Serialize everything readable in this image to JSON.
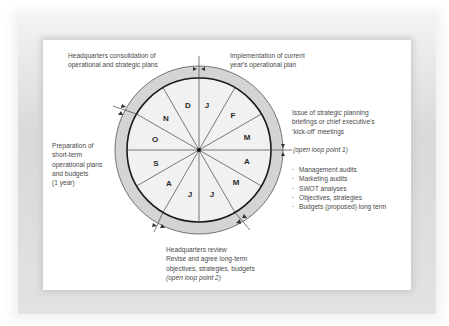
{
  "diagram": {
    "type": "planning-cycle-wheel",
    "months": [
      "J",
      "F",
      "M",
      "A",
      "M",
      "J",
      "J",
      "A",
      "S",
      "O",
      "N",
      "D"
    ],
    "annotations": {
      "top_left": [
        "Headquarters consolidation of",
        "operational and strategic plans"
      ],
      "top_right": [
        "Implementation of current",
        "year's operational plan"
      ],
      "right_upper": [
        "Issue of strategic planning",
        "briefings or chief executive's",
        "‘kick-off’ meetings"
      ],
      "right_loop": "(open loop point 1)",
      "right_bullets": [
        "Management audits",
        "Marketing audits",
        "SWOT analyses",
        "Objectives, strategies",
        "Budgets (proposed) long term"
      ],
      "left": [
        "Preparation of",
        "short-term",
        "operational plans",
        "and budgets",
        "(1 year)"
      ],
      "bottom": [
        "Headquarters review",
        "Revise and agree long-term",
        "objectives, strategies, budgets"
      ],
      "bottom_loop": "(open loop point 2)"
    },
    "colors": {
      "ring_fill": "#d4d4d4",
      "inner_fill": "#f1f1f1",
      "line": "#333333",
      "text": "#4a4a4a"
    }
  }
}
